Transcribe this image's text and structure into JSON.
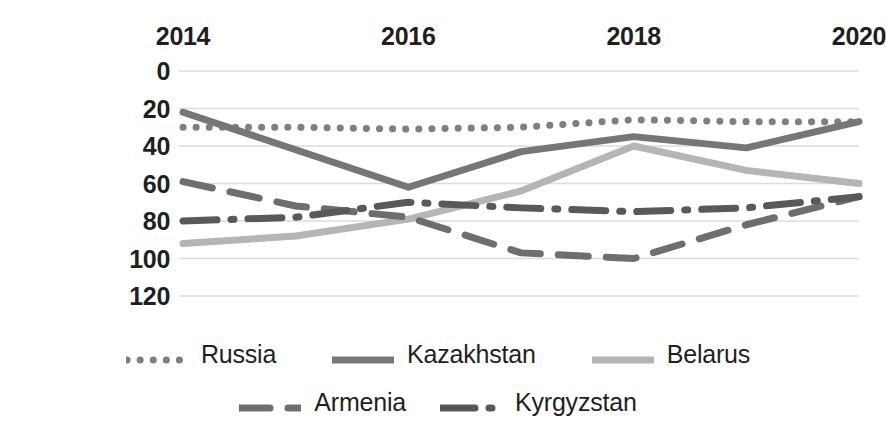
{
  "chart_data": {
    "type": "line",
    "title": "",
    "subtitle": "",
    "xlabel": "",
    "ylabel": "",
    "x": [
      2014,
      2015,
      2016,
      2017,
      2018,
      2019,
      2020
    ],
    "xticks": [
      "2014",
      "2016",
      "2018",
      "2020"
    ],
    "xtick_values": [
      2014,
      2016,
      2018,
      2020
    ],
    "yticks": [
      "0",
      "20",
      "40",
      "60",
      "80",
      "100",
      "120"
    ],
    "ytick_values": [
      0,
      20,
      40,
      60,
      80,
      100,
      120
    ],
    "ylim": [
      0,
      120
    ],
    "y_inverted": true,
    "xlim": [
      2014,
      2020
    ],
    "grid": "horizontal",
    "legend_position": "bottom",
    "series": [
      {
        "name": "Russia",
        "style": "dotted",
        "color": "#7f7f7f",
        "values": [
          30,
          30,
          31,
          30,
          26,
          27,
          27
        ]
      },
      {
        "name": "Kazakhstan",
        "style": "solid",
        "color": "#767676",
        "values": [
          22,
          42,
          62,
          43,
          35,
          41,
          27
        ]
      },
      {
        "name": "Belarus",
        "style": "solid",
        "color": "#b5b5b5",
        "values": [
          92,
          88,
          79,
          64,
          40,
          53,
          60
        ]
      },
      {
        "name": "Armenia",
        "style": "dashed",
        "color": "#6e6e6e",
        "values": [
          59,
          72,
          78,
          97,
          100,
          82,
          67
        ]
      },
      {
        "name": "Kyrgyzstan",
        "style": "dashdot",
        "color": "#595959",
        "values": [
          80,
          78,
          70,
          73,
          75,
          73,
          67
        ]
      }
    ]
  },
  "legend": {
    "rows": [
      [
        "Russia",
        "Kazakhstan",
        "Belarus"
      ],
      [
        "Armenia",
        "Kyrgyzstan"
      ]
    ]
  }
}
